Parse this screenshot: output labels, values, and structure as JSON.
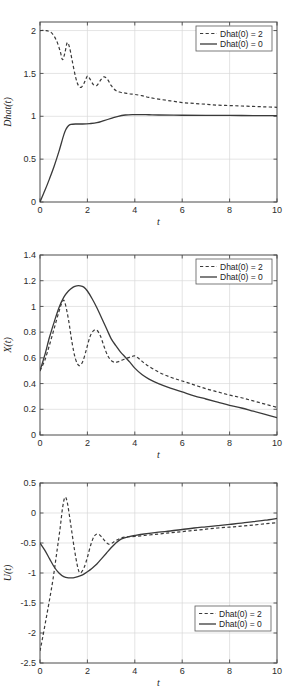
{
  "figure": {
    "background_color": "#ffffff",
    "line_color": "#3a3a3a",
    "grid_color": "#d8d8d8",
    "axis_color": "#4a4a4a",
    "panel_count": 3
  },
  "chart_data": [
    {
      "type": "line",
      "title": "",
      "xlabel": "t",
      "ylabel": "Dhat(t)",
      "xlim": [
        0,
        10
      ],
      "ylim": [
        0,
        2.1
      ],
      "xticks": [
        0,
        2,
        4,
        6,
        8,
        10
      ],
      "xticklabels": [
        "0",
        "2",
        "4",
        "6",
        "8",
        "10"
      ],
      "yticks": [
        0,
        0.5,
        1,
        1.5,
        2
      ],
      "yticklabels": [
        "0",
        "0.5",
        "1",
        "1.5",
        "2"
      ],
      "grid": true,
      "legend_position": "upper right",
      "series": [
        {
          "name": "Dhat(0) = 2",
          "style": "dashed",
          "x": [
            0,
            0.25,
            0.5,
            0.7,
            0.85,
            0.95,
            1.05,
            1.15,
            1.25,
            1.35,
            1.5,
            1.62,
            1.75,
            1.9,
            2.0,
            2.1,
            2.25,
            2.4,
            2.55,
            2.7,
            2.85,
            3.0,
            3.2,
            3.4,
            3.6,
            3.8,
            4.0,
            4.3,
            4.6,
            5.0,
            5.5,
            6.0,
            6.5,
            7.0,
            7.5,
            8.0,
            8.5,
            9.0,
            9.5,
            10.0
          ],
          "y": [
            2.0,
            2.0,
            1.97,
            1.88,
            1.76,
            1.66,
            1.74,
            1.86,
            1.8,
            1.66,
            1.46,
            1.36,
            1.34,
            1.41,
            1.47,
            1.44,
            1.37,
            1.36,
            1.42,
            1.46,
            1.43,
            1.36,
            1.3,
            1.28,
            1.27,
            1.26,
            1.255,
            1.24,
            1.22,
            1.2,
            1.18,
            1.16,
            1.15,
            1.14,
            1.13,
            1.125,
            1.12,
            1.115,
            1.11,
            1.105
          ]
        },
        {
          "name": "Dhat(0) = 0",
          "style": "solid",
          "x": [
            0,
            0.2,
            0.4,
            0.6,
            0.8,
            1.0,
            1.1,
            1.2,
            1.3,
            1.5,
            1.8,
            2.1,
            2.4,
            2.7,
            3.0,
            3.3,
            3.6,
            3.9,
            4.2,
            4.6,
            5.0,
            6.0,
            7.0,
            8.0,
            9.0,
            10.0
          ],
          "y": [
            0.0,
            0.13,
            0.27,
            0.42,
            0.59,
            0.78,
            0.85,
            0.89,
            0.905,
            0.91,
            0.91,
            0.915,
            0.925,
            0.95,
            0.975,
            1.0,
            1.015,
            1.02,
            1.02,
            1.018,
            1.015,
            1.012,
            1.01,
            1.01,
            1.008,
            1.008
          ]
        }
      ]
    },
    {
      "type": "line",
      "title": "",
      "xlabel": "t",
      "ylabel": "X(t)",
      "xlim": [
        0,
        10
      ],
      "ylim": [
        0,
        1.4
      ],
      "xticks": [
        0,
        2,
        4,
        6,
        8,
        10
      ],
      "xticklabels": [
        "0",
        "2",
        "4",
        "6",
        "8",
        "10"
      ],
      "yticks": [
        0,
        0.2,
        0.4,
        0.6,
        0.8,
        1.0,
        1.2,
        1.4
      ],
      "yticklabels": [
        "0",
        "0.2",
        "0.4",
        "0.6",
        "0.8",
        "1",
        "1.2",
        "1.4"
      ],
      "grid": true,
      "legend_position": "upper right",
      "series": [
        {
          "name": "Dhat(0) = 2",
          "style": "dashed",
          "x": [
            0,
            0.2,
            0.4,
            0.6,
            0.8,
            0.95,
            1.05,
            1.2,
            1.35,
            1.5,
            1.65,
            1.8,
            1.95,
            2.1,
            2.25,
            2.4,
            2.55,
            2.7,
            2.85,
            3.0,
            3.15,
            3.3,
            3.5,
            3.7,
            3.9,
            4.0,
            4.2,
            4.5,
            5.0,
            5.5,
            6.0,
            6.5,
            7.0,
            7.5,
            8.0,
            8.5,
            9.0,
            9.5,
            10.0
          ],
          "y": [
            0.5,
            0.58,
            0.7,
            0.83,
            0.96,
            1.04,
            1.03,
            0.9,
            0.72,
            0.59,
            0.54,
            0.57,
            0.66,
            0.76,
            0.81,
            0.815,
            0.77,
            0.69,
            0.62,
            0.58,
            0.565,
            0.57,
            0.585,
            0.6,
            0.612,
            0.615,
            0.59,
            0.545,
            0.49,
            0.45,
            0.42,
            0.39,
            0.36,
            0.335,
            0.31,
            0.29,
            0.265,
            0.24,
            0.215
          ]
        },
        {
          "name": "Dhat(0) = 0",
          "style": "solid",
          "x": [
            0,
            0.2,
            0.4,
            0.6,
            0.8,
            1.0,
            1.2,
            1.4,
            1.55,
            1.7,
            1.85,
            2.0,
            2.2,
            2.4,
            2.6,
            2.8,
            3.0,
            3.2,
            3.4,
            3.6,
            3.8,
            4.0,
            4.3,
            4.6,
            5.0,
            5.5,
            6.0,
            6.5,
            7.0,
            7.5,
            8.0,
            8.5,
            9.0,
            9.5,
            10.0
          ],
          "y": [
            0.5,
            0.62,
            0.76,
            0.88,
            0.99,
            1.07,
            1.12,
            1.15,
            1.16,
            1.16,
            1.15,
            1.12,
            1.06,
            0.99,
            0.91,
            0.83,
            0.75,
            0.695,
            0.645,
            0.605,
            0.565,
            0.52,
            0.47,
            0.435,
            0.4,
            0.365,
            0.335,
            0.305,
            0.28,
            0.255,
            0.23,
            0.21,
            0.185,
            0.16,
            0.135
          ]
        }
      ]
    },
    {
      "type": "line",
      "title": "",
      "xlabel": "t",
      "ylabel": "U(t)",
      "xlim": [
        0,
        10
      ],
      "ylim": [
        -2.5,
        0.5
      ],
      "xticks": [
        0,
        2,
        4,
        6,
        8,
        10
      ],
      "xticklabels": [
        "0",
        "2",
        "4",
        "6",
        "8",
        "10"
      ],
      "yticks": [
        -2.5,
        -2,
        -1.5,
        -1,
        -0.5,
        0,
        0.5
      ],
      "yticklabels": [
        "-2.5",
        "-2",
        "-1.5",
        "-1",
        "-0.5",
        "0",
        "0.5"
      ],
      "grid": true,
      "legend_position": "lower right",
      "series": [
        {
          "name": "Dhat(0) = 2",
          "style": "dashed",
          "x": [
            0,
            0.1,
            0.25,
            0.4,
            0.55,
            0.7,
            0.85,
            0.95,
            1.05,
            1.15,
            1.3,
            1.45,
            1.6,
            1.7,
            1.85,
            2.0,
            2.15,
            2.3,
            2.45,
            2.6,
            2.75,
            2.9,
            3.05,
            3.2,
            3.4,
            3.6,
            3.8,
            4.0,
            4.4,
            5.0,
            5.5,
            6.0,
            6.5,
            7.0,
            7.5,
            8.0,
            8.5,
            9.0,
            9.5,
            10.0
          ],
          "y": [
            -2.3,
            -2.1,
            -1.78,
            -1.45,
            -1.1,
            -0.68,
            -0.25,
            0.08,
            0.26,
            0.18,
            -0.2,
            -0.6,
            -0.92,
            -1.0,
            -0.92,
            -0.74,
            -0.52,
            -0.38,
            -0.35,
            -0.4,
            -0.47,
            -0.52,
            -0.5,
            -0.46,
            -0.42,
            -0.4,
            -0.395,
            -0.39,
            -0.375,
            -0.35,
            -0.33,
            -0.31,
            -0.29,
            -0.27,
            -0.25,
            -0.235,
            -0.22,
            -0.2,
            -0.18,
            -0.16
          ]
        },
        {
          "name": "Dhat(0) = 0",
          "style": "solid",
          "x": [
            0,
            0.2,
            0.4,
            0.6,
            0.8,
            1.0,
            1.2,
            1.4,
            1.6,
            1.8,
            2.0,
            2.2,
            2.4,
            2.6,
            2.8,
            3.0,
            3.2,
            3.4,
            3.6,
            3.8,
            4.0,
            4.4,
            5.0,
            5.5,
            6.0,
            6.5,
            7.0,
            7.5,
            8.0,
            8.5,
            9.0,
            9.5,
            10.0
          ],
          "y": [
            -0.5,
            -0.62,
            -0.76,
            -0.9,
            -1.0,
            -1.06,
            -1.08,
            -1.08,
            -1.06,
            -1.03,
            -0.98,
            -0.92,
            -0.85,
            -0.76,
            -0.67,
            -0.58,
            -0.5,
            -0.44,
            -0.41,
            -0.39,
            -0.375,
            -0.35,
            -0.32,
            -0.3,
            -0.275,
            -0.25,
            -0.23,
            -0.21,
            -0.19,
            -0.17,
            -0.145,
            -0.12,
            -0.09
          ]
        }
      ]
    }
  ],
  "legend": {
    "entry_dashed": "Dhat(0) = 2",
    "entry_solid": "Dhat(0) = 0"
  }
}
